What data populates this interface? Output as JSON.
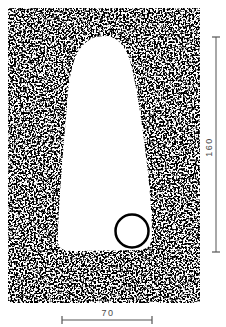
{
  "diagram": {
    "type": "technical-drawing",
    "background_color": "#ffffff",
    "fill_pattern": "stippled-noise",
    "stipple_colors": {
      "dark": "#000000",
      "light": "#ffffff"
    },
    "outer_block": {
      "shape": "rectangle",
      "fill": "stippled"
    },
    "cavity": {
      "shape": "tapered-rounded-slot",
      "fill": "#ffffff",
      "orientation": "vertical, narrow end at top"
    },
    "hole": {
      "shape": "circle",
      "stroke": "#000000",
      "fill": "#ffffff",
      "position": "bottom-right of cavity"
    },
    "dimensions": {
      "height": {
        "label": "160",
        "orientation": "vertical",
        "line_color": "#555555"
      },
      "width": {
        "label": "70",
        "orientation": "horizontal",
        "line_color": "#555555"
      }
    }
  }
}
